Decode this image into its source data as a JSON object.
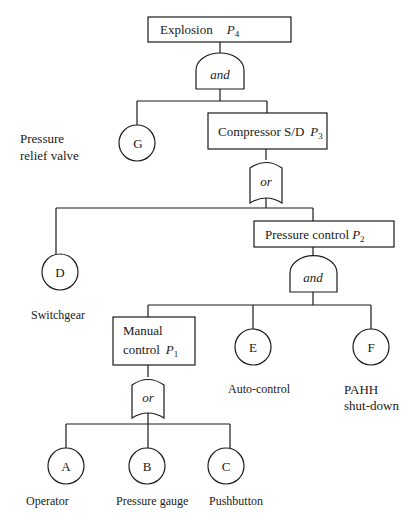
{
  "diagram": {
    "type": "fault-tree",
    "events": {
      "top": {
        "label": "Explosion",
        "prob": "P",
        "sub": "4"
      },
      "compressor": {
        "label": "Compressor S/D",
        "prob": "P",
        "sub": "3"
      },
      "pressure_control": {
        "label": "Pressure control",
        "prob": "P",
        "sub": "2"
      },
      "manual_line1": "Manual",
      "manual_line2": "control",
      "manual_prob": "P",
      "manual_sub": "1"
    },
    "gates": {
      "g1": "and",
      "g2": "or",
      "g3": "and",
      "g4": "or"
    },
    "basic_events": {
      "G": {
        "id": "G",
        "label_line1": "Pressure",
        "label_line2": "relief valve"
      },
      "D": {
        "id": "D",
        "label": "Switchgear"
      },
      "E": {
        "id": "E",
        "label": "Auto-control"
      },
      "F": {
        "id": "F",
        "label_line1": "PAHH",
        "label_line2": "shut-down"
      },
      "A": {
        "id": "A",
        "label": "Operator"
      },
      "B": {
        "id": "B",
        "label": "Pressure gauge"
      },
      "C": {
        "id": "C",
        "label": "Pushbutton"
      }
    }
  }
}
